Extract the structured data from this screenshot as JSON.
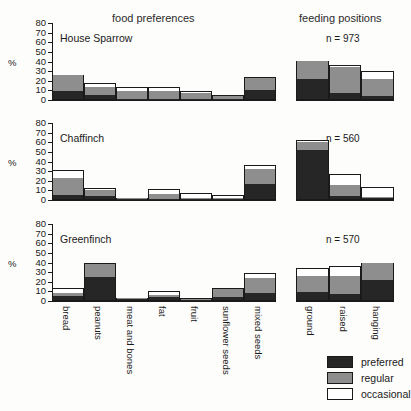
{
  "headings": {
    "food_preferences": "food preferences",
    "feeding_positions": "feeding positions"
  },
  "axis": {
    "unit_label": "%",
    "ticks": [
      "0",
      "10",
      "20",
      "30",
      "40",
      "50",
      "60",
      "70",
      "80"
    ]
  },
  "legend": {
    "items": [
      {
        "key": "preferred",
        "label": "preferred",
        "color": "#262626"
      },
      {
        "key": "regular",
        "label": "regular",
        "color": "#8e8e8e"
      },
      {
        "key": "occasional",
        "label": "occasional",
        "color": "#ffffff"
      }
    ]
  },
  "panels": [
    {
      "species": "House Sparrow",
      "n_label": "n = 973"
    },
    {
      "species": "Chaffinch",
      "n_label": "n = 560"
    },
    {
      "species": "Greenfinch",
      "n_label": "n = 570"
    }
  ],
  "categories": {
    "food": [
      "bread",
      "peanuts",
      "meat and bones",
      "fat",
      "fruit",
      "sunflower seeds",
      "mixed seeds"
    ],
    "positions": [
      "ground",
      "raised",
      "hanging"
    ]
  },
  "chart_data": {
    "type": "bar",
    "subtitle": "",
    "xlabel": "",
    "ylabel": "%",
    "ylim": [
      0,
      80
    ],
    "yticks": [
      0,
      10,
      20,
      30,
      40,
      50,
      60,
      70,
      80
    ],
    "grid": false,
    "stacked": true,
    "legend_position": "bottom-right",
    "series_names": [
      "preferred",
      "regular",
      "occasional"
    ],
    "series_colors": [
      "#262626",
      "#8e8e8e",
      "#ffffff"
    ],
    "panels": [
      {
        "species": "House Sparrow",
        "n": 973,
        "n_label": "n = 973",
        "food_preferences": {
          "categories": [
            "bread",
            "peanuts",
            "meat and bones",
            "fat",
            "fruit",
            "sunflower seeds",
            "mixed seeds"
          ],
          "series": [
            {
              "name": "preferred",
              "values": [
                9,
                5,
                1,
                1,
                1,
                1,
                10
              ]
            },
            {
              "name": "regular",
              "values": [
                17,
                9,
                8,
                8,
                6,
                3,
                13
              ]
            },
            {
              "name": "occasional",
              "values": [
                0,
                4,
                4,
                4,
                2,
                1,
                1
              ]
            }
          ],
          "totals": [
            26,
            18,
            13,
            13,
            9,
            5,
            24
          ]
        },
        "feeding_positions": {
          "categories": [
            "ground",
            "raised",
            "hanging"
          ],
          "series": [
            {
              "name": "preferred",
              "values": [
                22,
                7,
                4
              ]
            },
            {
              "name": "regular",
              "values": [
                19,
                27,
                18
              ]
            },
            {
              "name": "occasional",
              "values": [
                0,
                2,
                8
              ]
            }
          ],
          "totals": [
            41,
            36,
            30
          ]
        }
      },
      {
        "species": "Chaffinch",
        "n": 560,
        "n_label": "n = 560",
        "food_preferences": {
          "categories": [
            "bread",
            "peanuts",
            "meat and bones",
            "fat",
            "fruit",
            "sunflower seeds",
            "mixed seeds"
          ],
          "series": [
            {
              "name": "preferred",
              "values": [
                5,
                4,
                1,
                1,
                1,
                1,
                17
              ]
            },
            {
              "name": "regular",
              "values": [
                18,
                6,
                1,
                5,
                1,
                1,
                15
              ]
            },
            {
              "name": "occasional",
              "values": [
                8,
                2,
                0,
                5,
                5,
                3,
                4
              ]
            }
          ],
          "totals": [
            31,
            12,
            2,
            11,
            7,
            5,
            36
          ]
        },
        "feeding_positions": {
          "categories": [
            "ground",
            "raised",
            "hanging"
          ],
          "series": [
            {
              "name": "preferred",
              "values": [
                52,
                4,
                2
              ]
            },
            {
              "name": "regular",
              "values": [
                8,
                12,
                1
              ]
            },
            {
              "name": "occasional",
              "values": [
                2,
                11,
                11
              ]
            }
          ],
          "totals": [
            62,
            27,
            14
          ]
        }
      },
      {
        "species": "Greenfinch",
        "n": 570,
        "n_label": "n = 570",
        "food_preferences": {
          "categories": [
            "bread",
            "peanuts",
            "meat and bones",
            "fat",
            "fruit",
            "sunflower seeds",
            "mixed seeds"
          ],
          "series": [
            {
              "name": "preferred",
              "values": [
                5,
                25,
                2,
                4,
                1,
                4,
                8
              ]
            },
            {
              "name": "regular",
              "values": [
                3,
                13,
                1,
                2,
                1,
                8,
                16
              ]
            },
            {
              "name": "occasional",
              "values": [
                5,
                1,
                0,
                4,
                1,
                1,
                5
              ]
            }
          ],
          "totals": [
            13,
            39,
            3,
            10,
            3,
            13,
            29
          ]
        },
        "feeding_positions": {
          "categories": [
            "ground",
            "raised",
            "hanging"
          ],
          "series": [
            {
              "name": "preferred",
              "values": [
                9,
                7,
                22
              ]
            },
            {
              "name": "regular",
              "values": [
                17,
                19,
                18
              ]
            },
            {
              "name": "occasional",
              "values": [
                8,
                10,
                0
              ]
            }
          ],
          "totals": [
            34,
            36,
            40
          ]
        }
      }
    ]
  }
}
